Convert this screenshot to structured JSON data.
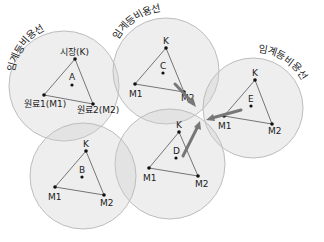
{
  "diagram": {
    "title": "",
    "arc_label": "임계등비용선",
    "colors": {
      "circle_fill": "#cfcfcf",
      "circle_stroke": "#bdbdbd",
      "line": "#555555",
      "dot": "#111111",
      "arrow": "#777777"
    },
    "regions": [
      {
        "id": "A",
        "center_label": "A",
        "k_label": "시장(K)",
        "m1_label": "원료1(M1)",
        "m2_label": "원료2(M2)",
        "arc_label": "임계등비용선"
      },
      {
        "id": "C",
        "center_label": "C",
        "k_label": "K",
        "m1_label": "M1",
        "m2_label": "M2",
        "arc_label": "임계등비용선"
      },
      {
        "id": "E",
        "center_label": "E",
        "k_label": "K",
        "m1_label": "M1",
        "m2_label": "M2",
        "arc_label": "임계등비용선"
      },
      {
        "id": "D",
        "center_label": "D",
        "k_label": "K",
        "m1_label": "M1",
        "m2_label": "M2"
      },
      {
        "id": "B",
        "center_label": "B",
        "k_label": "K",
        "m1_label": "M1",
        "m2_label": "M2"
      }
    ]
  }
}
